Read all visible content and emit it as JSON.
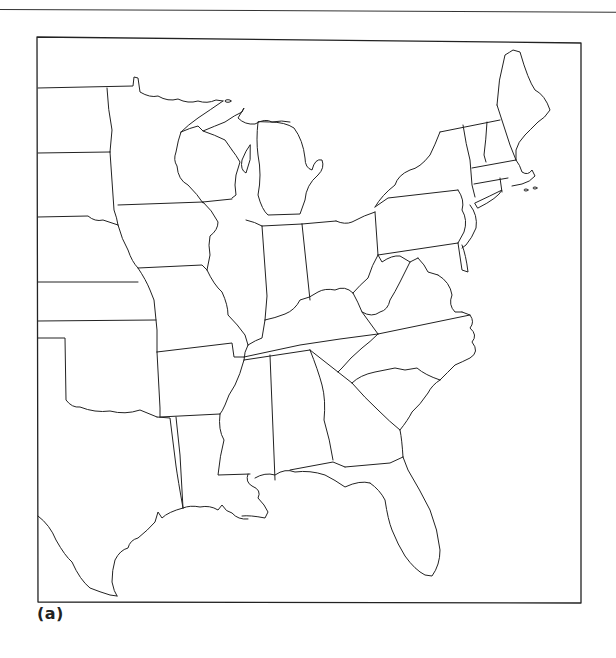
{
  "figure": {
    "caption": "(a)"
  },
  "map": {
    "frame": {
      "x": 37,
      "y": 37,
      "width": 544,
      "height": 566
    },
    "line_color": "#222222",
    "background": "#ffffff",
    "labels": []
  }
}
